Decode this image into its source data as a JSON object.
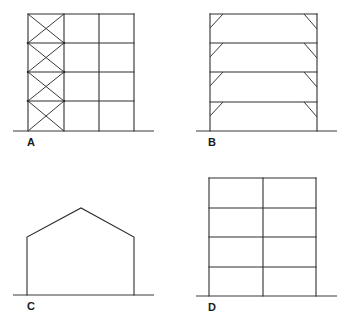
{
  "figure": {
    "line_color": "#2e2e2e",
    "background": "#ffffff",
    "panels": [
      {
        "label": "A",
        "type": "braced-frame",
        "description": "Three-bay, four-storey frame with X-bracing in the left bay",
        "bays": 3,
        "storeys": 4,
        "bracing": "X-bracing (left bay, every storey)"
      },
      {
        "label": "B",
        "type": "knee-braced-frame",
        "description": "Single-bay, four-storey frame with knee braces at each beam-column joint",
        "bays": 1,
        "storeys": 4,
        "bracing": "Knee braces at both ends of each beam"
      },
      {
        "label": "C",
        "type": "portal-frame",
        "description": "Single-storey pitched-roof portal frame",
        "bays": 1,
        "storeys": 1,
        "bracing": "None"
      },
      {
        "label": "D",
        "type": "moment-frame",
        "description": "Two-bay, four-storey rigid frame without bracing",
        "bays": 2,
        "storeys": 4,
        "bracing": "None"
      }
    ]
  }
}
